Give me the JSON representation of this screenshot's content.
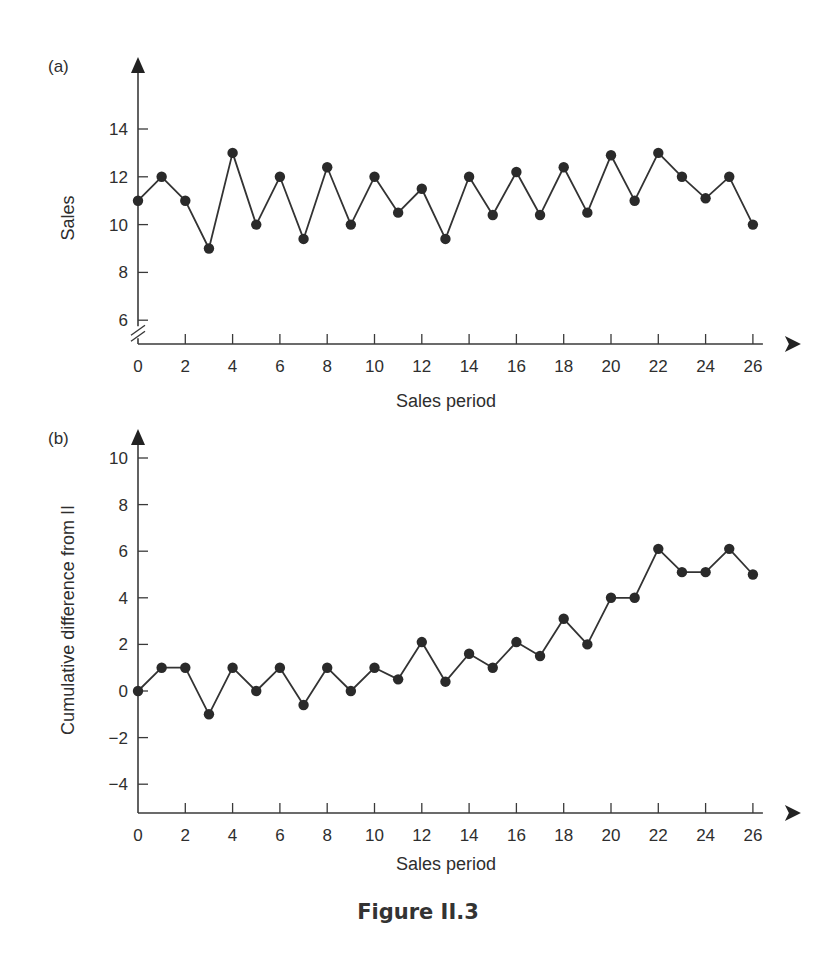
{
  "figure": {
    "caption": "Figure II.3"
  },
  "colors": {
    "line": "#333333",
    "marker": "#2a2a2a",
    "axis": "#3a3a3a",
    "text": "#2e2e2e"
  },
  "chart_data": [
    {
      "panel": "(a)",
      "type": "line",
      "title": "",
      "xlabel": "Sales period",
      "ylabel": "Sales",
      "x_ticks": [
        0,
        2,
        4,
        6,
        8,
        10,
        12,
        14,
        16,
        18,
        20,
        22,
        24,
        26
      ],
      "y_ticks": [
        6,
        8,
        10,
        12,
        14
      ],
      "xlim": [
        0,
        26
      ],
      "ylim": [
        6,
        16
      ],
      "y_axis_break": true,
      "grid": false,
      "legend": null,
      "markers": "filled circles",
      "x": [
        0,
        1,
        2,
        3,
        4,
        5,
        6,
        7,
        8,
        9,
        10,
        11,
        12,
        13,
        14,
        15,
        16,
        17,
        18,
        19,
        20,
        21,
        22,
        23,
        24,
        25,
        26
      ],
      "values": [
        11,
        12,
        11,
        9,
        13,
        10,
        12,
        9.4,
        12.4,
        10,
        12,
        10.5,
        11.5,
        9.4,
        12,
        10.4,
        12.2,
        10.4,
        12.4,
        10.5,
        12.9,
        11,
        13,
        12,
        11.1,
        12,
        10
      ]
    },
    {
      "panel": "(b)",
      "type": "line",
      "title": "",
      "xlabel": "Sales period",
      "ylabel": "Cumulative difference from II",
      "x_ticks": [
        0,
        2,
        4,
        6,
        8,
        10,
        12,
        14,
        16,
        18,
        20,
        22,
        24,
        26
      ],
      "y_ticks": [
        -4,
        -2,
        0,
        2,
        4,
        6,
        8,
        10
      ],
      "xlim": [
        0,
        26
      ],
      "ylim": [
        -5,
        11
      ],
      "grid": false,
      "legend": null,
      "markers": "filled circles",
      "x": [
        0,
        1,
        2,
        3,
        4,
        5,
        6,
        7,
        8,
        9,
        10,
        11,
        12,
        13,
        14,
        15,
        16,
        17,
        18,
        19,
        20,
        21,
        22,
        23,
        24,
        25,
        26
      ],
      "values": [
        0,
        1,
        1,
        -1,
        1,
        0,
        1,
        -0.6,
        1,
        0,
        1,
        0.5,
        2.1,
        0.4,
        1.6,
        1,
        2.1,
        1.5,
        3.1,
        2,
        4,
        4,
        6.1,
        5.1,
        5.1,
        6.1,
        5
      ]
    }
  ]
}
